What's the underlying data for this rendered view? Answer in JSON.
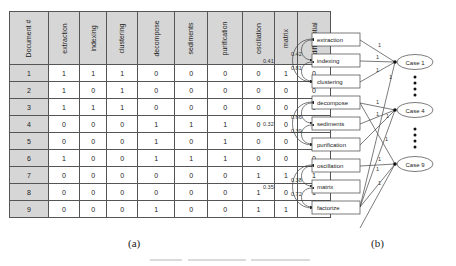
{
  "panel_a": {
    "caption": "(a)",
    "table": {
      "headers": [
        "Document #",
        "extraction",
        "indexing",
        "clustering",
        "decompose",
        "sediments",
        "purification",
        "oscillation",
        "matrix",
        "differential"
      ],
      "rows": [
        {
          "doc": "1",
          "values": [
            "1",
            "1",
            "1",
            "0",
            "0",
            "0",
            "0",
            "1",
            "0"
          ]
        },
        {
          "doc": "2",
          "values": [
            "1",
            "0",
            "1",
            "0",
            "0",
            "0",
            "0",
            "0",
            "0"
          ]
        },
        {
          "doc": "3",
          "values": [
            "1",
            "1",
            "1",
            "0",
            "0",
            "0",
            "0",
            "0",
            "0"
          ]
        },
        {
          "doc": "4",
          "values": [
            "0",
            "0",
            "0",
            "1",
            "1",
            "1",
            "0",
            "0",
            "0"
          ]
        },
        {
          "doc": "5",
          "values": [
            "0",
            "0",
            "0",
            "1",
            "0",
            "1",
            "0",
            "0",
            "0"
          ]
        },
        {
          "doc": "6",
          "values": [
            "1",
            "0",
            "0",
            "1",
            "1",
            "1",
            "0",
            "0",
            "0"
          ]
        },
        {
          "doc": "7",
          "values": [
            "0",
            "0",
            "0",
            "0",
            "0",
            "0",
            "1",
            "1",
            "1"
          ]
        },
        {
          "doc": "8",
          "values": [
            "0",
            "0",
            "0",
            "0",
            "0",
            "0",
            "1",
            "0",
            "1"
          ]
        },
        {
          "doc": "9",
          "values": [
            "0",
            "0",
            "0",
            "1",
            "0",
            "0",
            "1",
            "1",
            "1"
          ]
        }
      ]
    }
  },
  "panel_b": {
    "caption": "(b)",
    "terms": [
      "extraction",
      "indexing",
      "clustering",
      "decompose",
      "sediments",
      "purification",
      "oscillation",
      "matrix",
      "factorize"
    ],
    "cases": [
      "Case 1",
      "Case 4",
      "Case 9"
    ],
    "correlations": {
      "group1": {
        "outer": "0.41",
        "pair1": "0.42",
        "pair2": "0.81"
      },
      "group2": {
        "outer": "0.32",
        "pair1": "0.66",
        "pair2": "0.39"
      },
      "group3": {
        "outer": "0.35",
        "pair1": "0.38",
        "pair2": "0.72"
      }
    },
    "edges": [
      {
        "from": "extraction",
        "to": "Case 1",
        "weight": "1"
      },
      {
        "from": "indexing",
        "to": "Case 1",
        "weight": "1"
      },
      {
        "from": "clustering",
        "to": "Case 1",
        "weight": "1"
      },
      {
        "from": "matrix",
        "to": "Case 1",
        "weight": "1"
      },
      {
        "from": "decompose",
        "to": "Case 4",
        "weight": "1"
      },
      {
        "from": "sediments",
        "to": "Case 4",
        "weight": "1"
      },
      {
        "from": "purification",
        "to": "Case 4",
        "weight": "1"
      },
      {
        "from": "matrix",
        "to": "Case 4",
        "weight": "1"
      },
      {
        "from": "decompose",
        "to": "Case 9",
        "weight": "1"
      },
      {
        "from": "oscillation",
        "to": "Case 9",
        "weight": "1"
      },
      {
        "from": "matrix",
        "to": "Case 9",
        "weight": "1"
      },
      {
        "from": "factorize",
        "to": "Case 9",
        "weight": "1"
      }
    ],
    "edge_weight_label": "1"
  }
}
